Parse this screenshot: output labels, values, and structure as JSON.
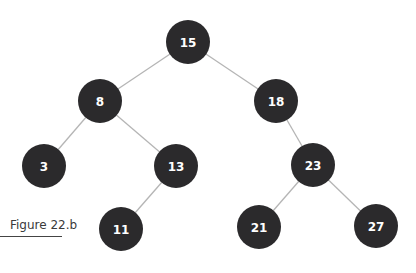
{
  "figure": {
    "caption": "Figure 22.b",
    "type": "binary-search-tree",
    "node_color": "#2b2a2c",
    "edge_color": "#b5b5b5",
    "text_color": "#ffffff"
  },
  "nodes": [
    {
      "id": "n15",
      "label": "15",
      "x": 188,
      "y": 42
    },
    {
      "id": "n8",
      "label": "8",
      "x": 100,
      "y": 101
    },
    {
      "id": "n18",
      "label": "18",
      "x": 276,
      "y": 101
    },
    {
      "id": "n3",
      "label": "3",
      "x": 44,
      "y": 166
    },
    {
      "id": "n13",
      "label": "13",
      "x": 176,
      "y": 166
    },
    {
      "id": "n23",
      "label": "23",
      "x": 313,
      "y": 165
    },
    {
      "id": "n11",
      "label": "11",
      "x": 121,
      "y": 229
    },
    {
      "id": "n21",
      "label": "21",
      "x": 259,
      "y": 227
    },
    {
      "id": "n27",
      "label": "27",
      "x": 376,
      "y": 226
    }
  ],
  "edges": [
    [
      "n15",
      "n8"
    ],
    [
      "n15",
      "n18"
    ],
    [
      "n8",
      "n3"
    ],
    [
      "n8",
      "n13"
    ],
    [
      "n18",
      "n23"
    ],
    [
      "n13",
      "n11"
    ],
    [
      "n23",
      "n21"
    ],
    [
      "n23",
      "n27"
    ]
  ]
}
